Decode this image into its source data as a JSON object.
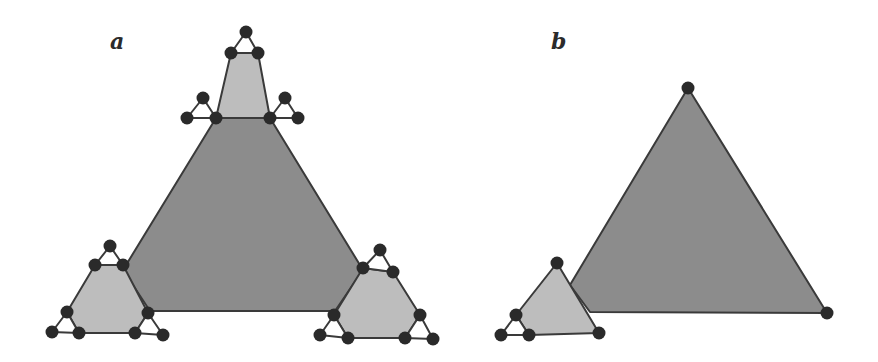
{
  "panels": [
    {
      "id": "a",
      "label": "a",
      "label_pos": [
        110,
        52
      ]
    },
    {
      "id": "b",
      "label": "b",
      "label_pos": [
        551,
        52
      ]
    }
  ],
  "colors": {
    "large_fill": "#8c8c8c",
    "small_fill": "#bdbdbd",
    "node": "#2a2a2a",
    "edge": "#3a3a3a"
  },
  "diagram": {
    "a": {
      "large_triangle": [
        [
          216,
          118
        ],
        [
          270,
          118
        ],
        [
          363,
          270
        ],
        [
          335,
          311
        ],
        [
          150,
          311
        ],
        [
          123,
          270
        ]
      ],
      "small_triangles": [
        [
          [
            231,
            53
          ],
          [
            258,
            53
          ],
          [
            270,
            118
          ],
          [
            216,
            118
          ]
        ],
        [
          [
            95,
            265
          ],
          [
            123,
            265
          ],
          [
            148,
            313
          ],
          [
            135,
            333
          ],
          [
            79,
            333
          ],
          [
            67,
            312
          ]
        ],
        [
          [
            363,
            268
          ],
          [
            393,
            272
          ],
          [
            420,
            315
          ],
          [
            405,
            338
          ],
          [
            348,
            338
          ],
          [
            334,
            315
          ]
        ]
      ],
      "tiny_triangles": [
        [
          [
            246,
            32
          ],
          [
            231,
            53
          ],
          [
            258,
            53
          ]
        ],
        [
          [
            203,
            98
          ],
          [
            187,
            118
          ],
          [
            216,
            118
          ]
        ],
        [
          [
            285,
            98
          ],
          [
            270,
            118
          ],
          [
            298,
            118
          ]
        ],
        [
          [
            110,
            246
          ],
          [
            95,
            265
          ],
          [
            123,
            265
          ]
        ],
        [
          [
            67,
            312
          ],
          [
            52,
            332
          ],
          [
            79,
            333
          ]
        ],
        [
          [
            148,
            313
          ],
          [
            135,
            333
          ],
          [
            163,
            335
          ]
        ],
        [
          [
            380,
            250
          ],
          [
            363,
            268
          ],
          [
            393,
            272
          ]
        ],
        [
          [
            334,
            315
          ],
          [
            320,
            335
          ],
          [
            348,
            338
          ]
        ],
        [
          [
            420,
            315
          ],
          [
            405,
            338
          ],
          [
            433,
            339
          ]
        ]
      ]
    },
    "b": {
      "large_triangle": [
        [
          688,
          88
        ],
        [
          827,
          313
        ],
        [
          590,
          312
        ],
        [
          570,
          285
        ]
      ],
      "small_triangle": [
        [
          557,
          263
        ],
        [
          599,
          333
        ],
        [
          529,
          335
        ],
        [
          516,
          315
        ]
      ],
      "tiny_triangle": [
        [
          516,
          315
        ],
        [
          501,
          335
        ],
        [
          529,
          335
        ]
      ],
      "nodes": [
        [
          688,
          88
        ],
        [
          827,
          313
        ],
        [
          557,
          263
        ],
        [
          599,
          333
        ],
        [
          516,
          315
        ],
        [
          501,
          335
        ],
        [
          529,
          335
        ]
      ]
    }
  }
}
